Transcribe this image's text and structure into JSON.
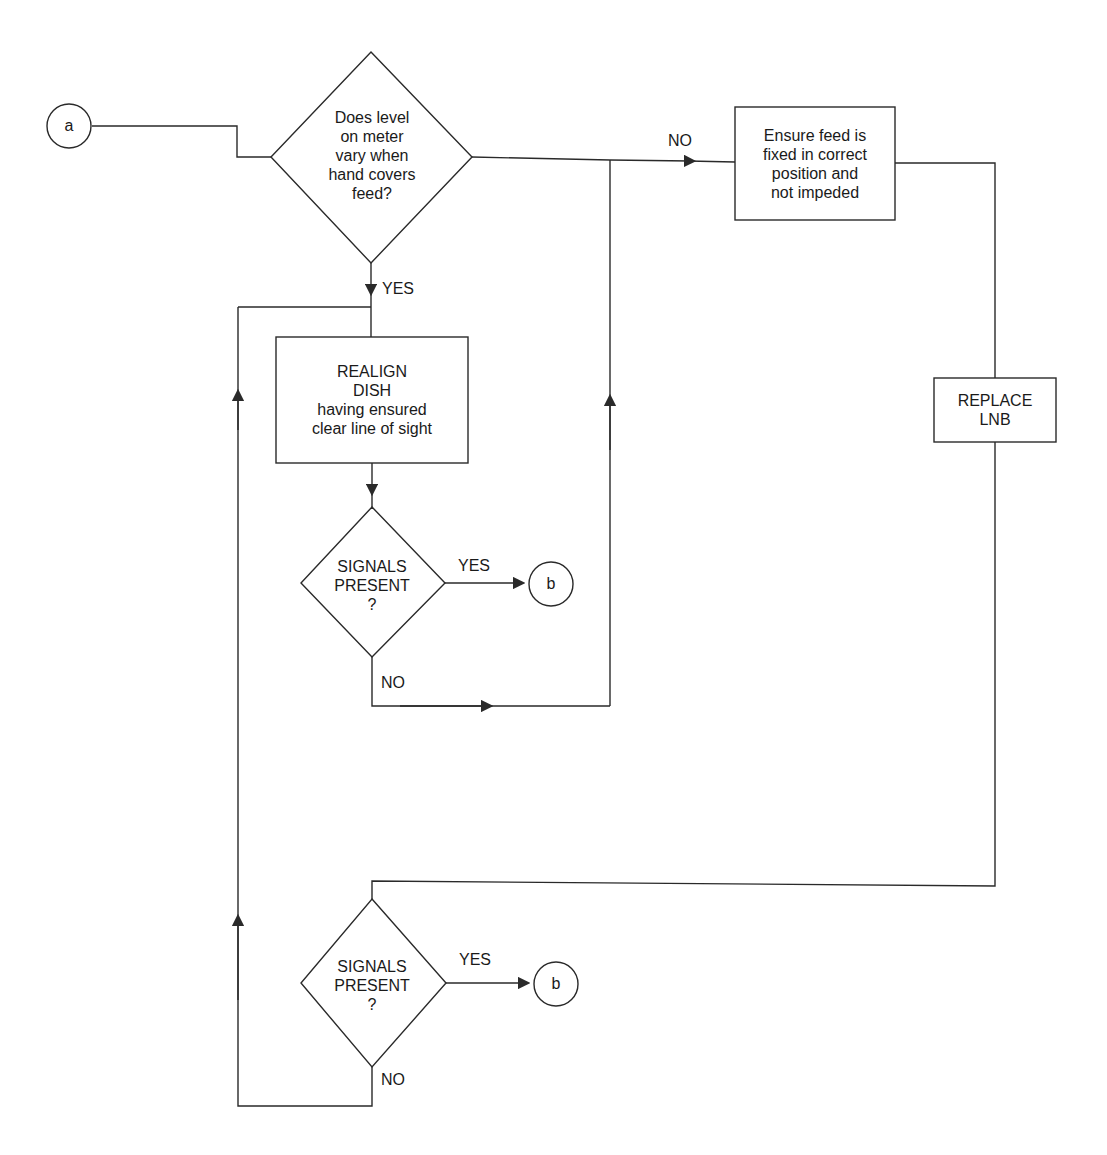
{
  "diagram": {
    "type": "flowchart",
    "colors": {
      "stroke": "#2a2a2a",
      "text": "#1a1a1a",
      "background": "#ffffff"
    },
    "connectors": {
      "start": {
        "label": "a"
      },
      "end1": {
        "label": "b"
      },
      "end2": {
        "label": "b"
      }
    },
    "decisions": {
      "level_varies": {
        "lines": [
          "Does level",
          "on meter",
          "vary when",
          "hand covers",
          "feed?"
        ]
      },
      "signals1": {
        "lines": [
          "SIGNALS",
          "PRESENT",
          "?"
        ]
      },
      "signals2": {
        "lines": [
          "SIGNALS",
          "PRESENT",
          "?"
        ]
      }
    },
    "processes": {
      "ensure_feed": {
        "lines": [
          "Ensure feed is",
          "fixed in correct",
          "position and",
          "not impeded"
        ]
      },
      "realign_dish": {
        "lines": [
          "REALIGN",
          "DISH",
          "having ensured",
          "clear line of sight"
        ]
      },
      "replace_lnb": {
        "lines": [
          "REPLACE",
          "LNB"
        ]
      }
    },
    "edge_labels": {
      "level_no": "NO",
      "level_yes": "YES",
      "signals1_yes": "YES",
      "signals1_no": "NO",
      "signals2_yes": "YES",
      "signals2_no": "NO"
    }
  }
}
